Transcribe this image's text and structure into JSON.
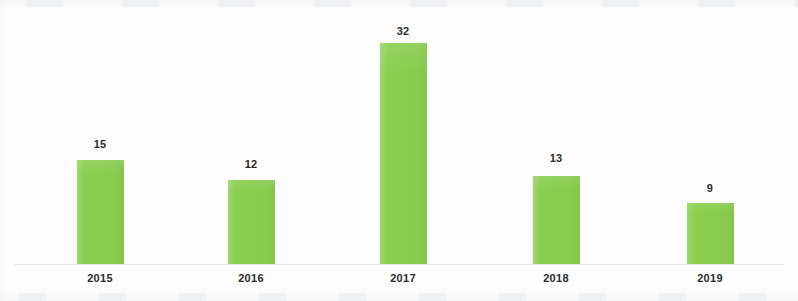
{
  "chart_data": {
    "type": "bar",
    "title": "",
    "subtitle": "",
    "xlabel": "",
    "ylabel": "",
    "categories": [
      "2015",
      "2016",
      "2017",
      "2018",
      "2019"
    ],
    "values": [
      15,
      12,
      32,
      13,
      9
    ],
    "value_labels": [
      "15",
      "12",
      "32",
      "13",
      "9"
    ],
    "series": [
      {
        "name": "",
        "values": [
          15,
          12,
          32,
          13,
          9
        ]
      }
    ],
    "ylim": [
      0,
      32
    ],
    "grid": false,
    "legend": false,
    "legend_position": "none",
    "show_value_labels": true,
    "show_y_axis": false,
    "show_x_axis_line": true,
    "bar_color": "#8ace4f",
    "label_color": "#2b2b2b",
    "axis_line_color": "#e6e8ea",
    "background_color": "#fdfdfd"
  },
  "geometry": {
    "canvas_width": 798,
    "canvas_height": 301,
    "baseline_y": 264,
    "bar_width": 47,
    "unit_px": 6.91,
    "bars": [
      {
        "x_center": 100,
        "left": 77,
        "top": 160,
        "height": 104
      },
      {
        "x_center": 251,
        "left": 228,
        "top": 180,
        "height": 84
      },
      {
        "x_center": 403,
        "left": 380,
        "top": 43,
        "height": 221
      },
      {
        "x_center": 556,
        "left": 533,
        "top": 176,
        "height": 88
      },
      {
        "x_center": 710,
        "left": 687,
        "top": 203,
        "height": 61
      }
    ],
    "value_label_y": [
      138,
      158,
      25,
      152,
      182
    ],
    "category_label_y": 272,
    "axis_line": {
      "left": 14,
      "top": 264,
      "width": 770
    }
  }
}
